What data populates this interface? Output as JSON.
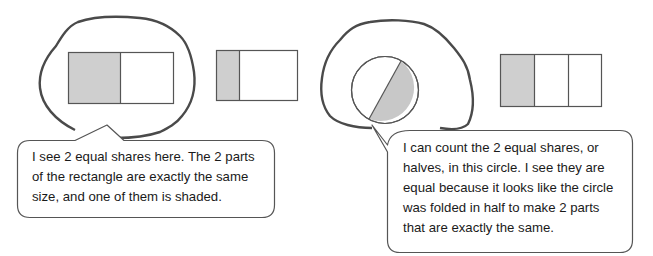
{
  "figures": [
    {
      "id": "rect-halves",
      "type": "rectangle",
      "parts": 2,
      "shaded_parts": 1,
      "equal_parts": true,
      "circled": true
    },
    {
      "id": "rect-unequal",
      "type": "rectangle",
      "parts": 2,
      "shaded_parts": 1,
      "equal_parts": false,
      "circled": false
    },
    {
      "id": "circle-halves",
      "type": "circle",
      "parts": 2,
      "shaded_parts": 1,
      "equal_parts": true,
      "circled": true
    },
    {
      "id": "rect-thirds",
      "type": "rectangle",
      "parts": 3,
      "shaded_parts": 1,
      "equal_parts": true,
      "circled": false
    }
  ],
  "callouts": {
    "left": {
      "lines": [
        "I see 2 equal shares here.  The 2 parts",
        "of the rectangle are exactly the same",
        "size, and one of them is shaded."
      ]
    },
    "right": {
      "lines": [
        "I can count the 2 equal shares, or",
        "halves, in this circle.  I see they are",
        "equal because it looks like the circle",
        "was folded in half to make 2 parts",
        "that are exactly the same."
      ]
    }
  },
  "colors": {
    "shade": "#cfcfcf",
    "outline": "#555555",
    "loop": "#4a4a4a"
  }
}
